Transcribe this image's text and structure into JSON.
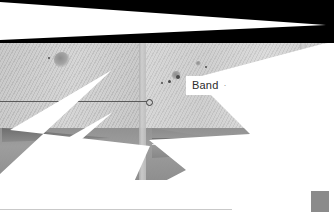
{
  "canvas": {
    "width": 334,
    "height": 222,
    "background": "#ffffff"
  },
  "top_band": {
    "name": "black-header-band",
    "fill": "#000000",
    "wedge_fill": "#ffffff"
  },
  "photo": {
    "description_alt": "",
    "base_color": "#c9c9c9",
    "panel_right_color": "#d8d8d8",
    "floor_color": "#8f8f8f",
    "seam_color": "#b0b0b0"
  },
  "overlays": {
    "mask_fill": "#ffffff",
    "wedge_dark_fill": "#8a8a8a",
    "wedge_bottom_left_fill": "#6e6e6e",
    "corner_box_fill": "#8b8b8b"
  },
  "annotations": {
    "rule_color": "#4f4f4f",
    "marker_color": "#3c3c3c",
    "bottom_rule_color": "#c9c9c9"
  },
  "label_chip": {
    "text": "Band",
    "trailing_mark": "·",
    "text_color": "#2b2b2b",
    "background": "#ffffff"
  },
  "knots": [
    {
      "x": 62,
      "y": 60,
      "size": 16
    },
    {
      "x": 176,
      "y": 75,
      "size": 9
    },
    {
      "x": 198,
      "y": 63,
      "size": 5
    }
  ],
  "specks": [
    {
      "x": 48,
      "y": 57,
      "size": 2
    },
    {
      "x": 161,
      "y": 82,
      "size": 2
    },
    {
      "x": 168,
      "y": 80,
      "size": 3
    },
    {
      "x": 177,
      "y": 76,
      "size": 4
    },
    {
      "x": 205,
      "y": 66,
      "size": 2
    }
  ]
}
